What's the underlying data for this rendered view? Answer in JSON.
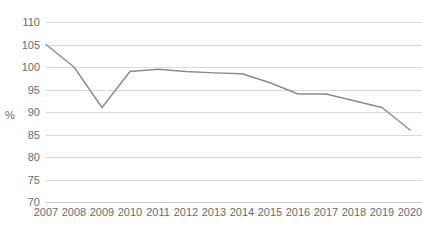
{
  "chart_data": {
    "type": "line",
    "title": "",
    "subtitle": "",
    "xlabel": "",
    "ylabel": "%",
    "categories": [
      "2007",
      "2008",
      "2009",
      "2010",
      "2011",
      "2012",
      "2013",
      "2014",
      "2015",
      "2016",
      "2017",
      "2018",
      "2019",
      "2020"
    ],
    "x": [
      2007,
      2008,
      2009,
      2010,
      2011,
      2012,
      2013,
      2014,
      2015,
      2016,
      2017,
      2018,
      2019,
      2020
    ],
    "values": [
      105,
      100,
      91,
      99,
      99.5,
      99,
      98.7,
      98.5,
      96.5,
      94,
      94,
      92.5,
      91,
      86
    ],
    "series": [
      {
        "name": "%",
        "values": [
          105,
          100,
          91,
          99,
          99.5,
          99,
          98.7,
          98.5,
          96.5,
          94,
          94,
          92.5,
          91,
          86
        ]
      }
    ],
    "ylim": [
      70,
      110
    ],
    "ytick_values": [
      70,
      75,
      80,
      85,
      90,
      95,
      100,
      105,
      110
    ],
    "ytick_labels": [
      "70",
      "75",
      "80",
      "85",
      "90",
      "95",
      "100",
      "105",
      "110"
    ],
    "xtick_labels": [
      "2007",
      "2008",
      "2009",
      "2010",
      "2011",
      "2012",
      "2013",
      "2014",
      "2015",
      "2016",
      "2017",
      "2018",
      "2019",
      "2020"
    ],
    "grid": true,
    "grid_axis": "y",
    "legend": false,
    "legend_position": "none",
    "annotations": [],
    "colors": {
      "line": "#8a8a8a",
      "grid": "#d9d9d9",
      "text": "#6b6b6b",
      "background": "#ffffff"
    }
  },
  "layout": {
    "plot_left": 46,
    "plot_right": 410,
    "plot_top": 22,
    "plot_bottom": 202,
    "ylabel_x": 10,
    "ylabel_y": 119
  }
}
